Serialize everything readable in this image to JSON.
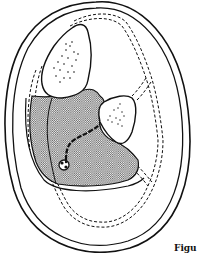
{
  "figure": {
    "caption": "Figu",
    "colors": {
      "line": "#111111",
      "background": "#ffffff",
      "shade": "#7a7a7a"
    },
    "structures": [
      {
        "id": "outer-skin",
        "style": "double solid line"
      },
      {
        "id": "deep-fascia",
        "style": "double dashed line"
      },
      {
        "id": "large-bone",
        "style": "solid outline with stippled marrow"
      },
      {
        "id": "small-bone",
        "style": "solid outline with stippled marrow"
      },
      {
        "id": "shaded-compartment",
        "style": "crosshatch fill"
      },
      {
        "id": "vessel-nerve",
        "style": "dark dashed stroke"
      },
      {
        "id": "vessel-bundle",
        "style": "small circular knot"
      }
    ]
  }
}
